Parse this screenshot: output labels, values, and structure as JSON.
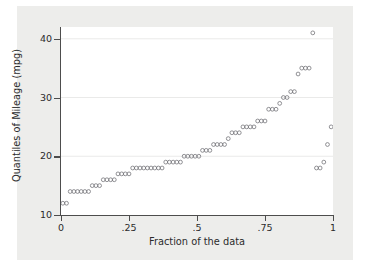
{
  "chart_data": {
    "type": "scatter",
    "title": "",
    "subtitle": "",
    "xlabel": "Fraction of the data",
    "ylabel": "Quantiles of Mileage (mpg)",
    "xlim": [
      0,
      1
    ],
    "ylim": [
      10,
      42
    ],
    "xticks": [
      0,
      0.25,
      0.5,
      0.75,
      1
    ],
    "xticklabels": [
      "0",
      ".25",
      ".5",
      ".75",
      "1"
    ],
    "yticks": [
      10,
      20,
      30,
      40
    ],
    "yticklabels": [
      "10",
      "20",
      "30",
      "40"
    ],
    "grid": true,
    "gridlines_y": [
      20,
      30,
      40
    ],
    "legend": null,
    "marker": "open-circle",
    "marker_color": "#6e6e73",
    "n_points": 74,
    "x": [
      0.0068,
      0.0203,
      0.0338,
      0.0473,
      0.0608,
      0.0743,
      0.0878,
      0.1014,
      0.1149,
      0.1284,
      0.1419,
      0.1554,
      0.1689,
      0.1824,
      0.1959,
      0.2095,
      0.223,
      0.2365,
      0.25,
      0.2635,
      0.277,
      0.2905,
      0.3041,
      0.3176,
      0.3311,
      0.3446,
      0.3581,
      0.3716,
      0.3851,
      0.3986,
      0.4122,
      0.4257,
      0.4392,
      0.4527,
      0.4662,
      0.4797,
      0.4932,
      0.5068,
      0.5203,
      0.5338,
      0.5473,
      0.5608,
      0.5743,
      0.5878,
      0.6014,
      0.6149,
      0.6284,
      0.6419,
      0.6554,
      0.6689,
      0.6824,
      0.6959,
      0.7095,
      0.723,
      0.7365,
      0.75,
      0.7635,
      0.777,
      0.7905,
      0.8041,
      0.8176,
      0.8311,
      0.8446,
      0.8581,
      0.8716,
      0.8851,
      0.8986,
      0.9122,
      0.9257,
      0.9392,
      0.9527,
      0.9662,
      0.9797,
      0.9932
    ],
    "y": [
      12,
      12,
      14,
      14,
      14,
      14,
      14,
      14,
      15,
      15,
      15,
      16,
      16,
      16,
      16,
      17,
      17,
      17,
      17,
      18,
      18,
      18,
      18,
      18,
      18,
      18,
      18,
      18,
      19,
      19,
      19,
      19,
      19,
      20,
      20,
      20,
      20,
      20,
      21,
      21,
      21,
      22,
      22,
      22,
      22,
      23,
      24,
      24,
      24,
      25,
      25,
      25,
      25,
      26,
      26,
      26,
      28,
      28,
      28,
      29,
      30,
      30,
      31,
      31,
      34,
      35,
      35,
      35,
      41,
      18,
      18,
      19,
      22,
      25
    ]
  },
  "axes": {
    "y_title": "Quantiles of Mileage (mpg)",
    "x_title": "Fraction of the data"
  }
}
